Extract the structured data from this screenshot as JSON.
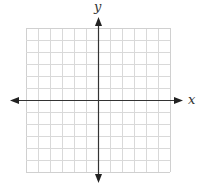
{
  "diagram": {
    "type": "coordinate-plane",
    "x_axis_label": "x",
    "y_axis_label": "y",
    "grid": {
      "columns": 12,
      "rows": 12,
      "cell_size_px": 12,
      "left": 26,
      "top": 28,
      "line_color": "#d9d9d9",
      "border_color": "#d0d0d0"
    },
    "axes": {
      "color": "#333333",
      "origin_x": 98,
      "origin_y": 100,
      "x_axis_from": 10,
      "x_axis_to": 183,
      "y_axis_from": 17,
      "y_axis_to": 183
    }
  }
}
